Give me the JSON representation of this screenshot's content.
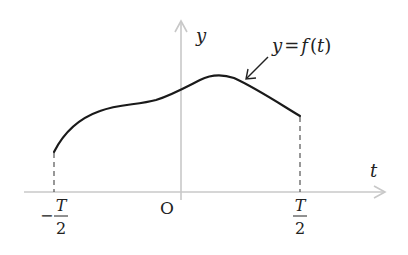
{
  "diagram": {
    "axes": {
      "x_label": "t",
      "y_label": "y",
      "origin_label": "O",
      "axis_color": "#c8c8c8"
    },
    "curve": {
      "label": "y = f(t)",
      "label_parts": {
        "lhs": "y",
        "eq": "=",
        "func": "f",
        "open": "(",
        "var": "t",
        "close": ")"
      },
      "color": "#1a1a1a"
    },
    "ticks": {
      "left": {
        "sign": "−",
        "numerator": "T",
        "denominator": "2"
      },
      "right": {
        "numerator": "T",
        "denominator": "2"
      }
    },
    "guide_color": "#444444"
  }
}
